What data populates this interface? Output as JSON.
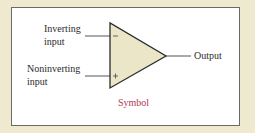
{
  "diagram": {
    "inputs": {
      "inverting": {
        "line1": "Inverting",
        "line2": "input",
        "sign": "−"
      },
      "noninverting": {
        "line1": "Noninverting",
        "line2": "input",
        "sign": "+"
      }
    },
    "output": {
      "label": "Output"
    },
    "caption": "Symbol"
  },
  "colors": {
    "background": "#efe9cf",
    "panel": "#ffffff",
    "panel_border": "#6b6b66",
    "triangle_fill": "#ebe6c8",
    "line": "#2b2b2b",
    "caption": "#b03a55"
  }
}
